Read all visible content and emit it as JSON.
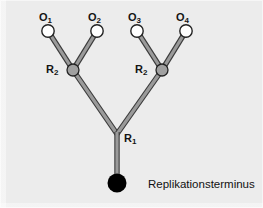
{
  "figure": {
    "kind": "replication-tree-diagram",
    "background_color": "#ececec",
    "page_color": "#ffffff",
    "branch_fill": "#9a9a9a",
    "branch_stroke": "#3a3a3a",
    "open_node_fill": "#ffffff",
    "open_node_stroke": "#232323",
    "gray_node_fill": "#a0a0a0",
    "gray_node_stroke": "#232323",
    "terminus_fill": "#000000"
  },
  "labels": {
    "origins": [
      {
        "id": "O1",
        "text": "O",
        "sub": "1",
        "x": 39,
        "y": 12
      },
      {
        "id": "O2",
        "text": "O",
        "sub": "2",
        "x": 88,
        "y": 12
      },
      {
        "id": "O3",
        "text": "O",
        "sub": "3",
        "x": 128,
        "y": 12
      },
      {
        "id": "O4",
        "text": "O",
        "sub": "4",
        "x": 176,
        "y": 12
      }
    ],
    "replication_forks": [
      {
        "id": "R2-left",
        "text": "R",
        "sub": "2",
        "x": 46,
        "y": 64
      },
      {
        "id": "R2-right",
        "text": "R",
        "sub": "2",
        "x": 135,
        "y": 64
      }
    ],
    "root_fork": {
      "id": "R1",
      "text": "R",
      "sub": "1",
      "x": 124,
      "y": 133
    },
    "terminus_caption": {
      "text": "Replikationsterminus",
      "x": 148,
      "y": 179
    }
  },
  "nodes": {
    "origins": [
      {
        "id": "O1",
        "cx": 48,
        "cy": 31,
        "r": 6.2,
        "type": "open"
      },
      {
        "id": "O2",
        "cx": 97,
        "cy": 31,
        "r": 6.2,
        "type": "open"
      },
      {
        "id": "O3",
        "cx": 137,
        "cy": 31,
        "r": 6.2,
        "type": "open"
      },
      {
        "id": "O4",
        "cx": 186,
        "cy": 31,
        "r": 6.2,
        "type": "open"
      }
    ],
    "forks": [
      {
        "id": "R2-left",
        "cx": 73,
        "cy": 70,
        "r": 6.0,
        "type": "gray"
      },
      {
        "id": "R2-right",
        "cx": 162,
        "cy": 70,
        "r": 6.0,
        "type": "gray"
      }
    ],
    "root": {
      "id": "R1",
      "cx": 117,
      "cy": 133,
      "type": "junction"
    },
    "terminus": {
      "id": "terminus",
      "cx": 117,
      "cy": 183,
      "r": 9.5,
      "type": "filled"
    }
  },
  "edges": [
    {
      "id": "edge-O1-R2left",
      "x1": 48,
      "y1": 31,
      "x2": 73,
      "y2": 70
    },
    {
      "id": "edge-O2-R2left",
      "x1": 97,
      "y1": 31,
      "x2": 73,
      "y2": 70
    },
    {
      "id": "edge-O3-R2right",
      "x1": 137,
      "y1": 31,
      "x2": 162,
      "y2": 70
    },
    {
      "id": "edge-O4-R2right",
      "x1": 186,
      "y1": 31,
      "x2": 162,
      "y2": 70
    },
    {
      "id": "edge-R2left-R1",
      "x1": 73,
      "y1": 70,
      "x2": 117,
      "y2": 134
    },
    {
      "id": "edge-R2right-R1",
      "x1": 162,
      "y1": 70,
      "x2": 117,
      "y2": 134
    },
    {
      "id": "edge-R1-terminus",
      "x1": 117,
      "y1": 132,
      "x2": 117,
      "y2": 183
    }
  ]
}
